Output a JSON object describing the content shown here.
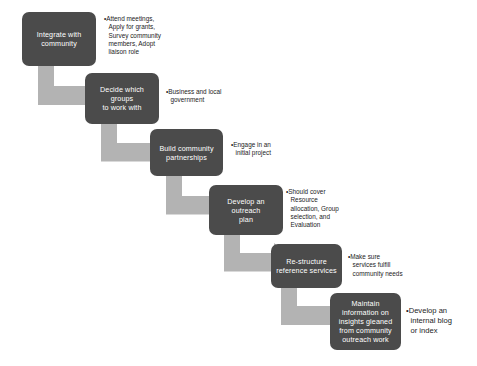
{
  "diagram": {
    "background_color": "#ffffff",
    "node_color": "#4b4b4b",
    "node_text_color": "#ffffff",
    "arrow_color": "#b3b3b3",
    "annotation_text_color": "#1c1c1c",
    "steps": [
      {
        "id": "step-1",
        "label": "Integrate with\ncommunity",
        "annotation": "•Attend meetings,\nApply for grants,\nSurvey community\nmembers, Adopt\nliaison role"
      },
      {
        "id": "step-2",
        "label": "Decide which groups\nto work with",
        "annotation": "•Business and local\ngovernment"
      },
      {
        "id": "step-3",
        "label": "Build community\npartnerships",
        "annotation": "•Engage in an\ninitial project"
      },
      {
        "id": "step-4",
        "label": "Develop an outreach\nplan",
        "annotation": "•Should cover\nResource\nallocation, Group\nselection, and\nEvaluation"
      },
      {
        "id": "step-5",
        "label": "Re-structure\nreference services",
        "annotation": "•Make sure\nservices fulfill\ncommunity needs"
      },
      {
        "id": "step-6",
        "label": "Maintain\ninformation on\ninsights gleaned\nfrom community\noutreach work",
        "annotation": "•Develop an\ninternal blog\nor index"
      }
    ]
  }
}
